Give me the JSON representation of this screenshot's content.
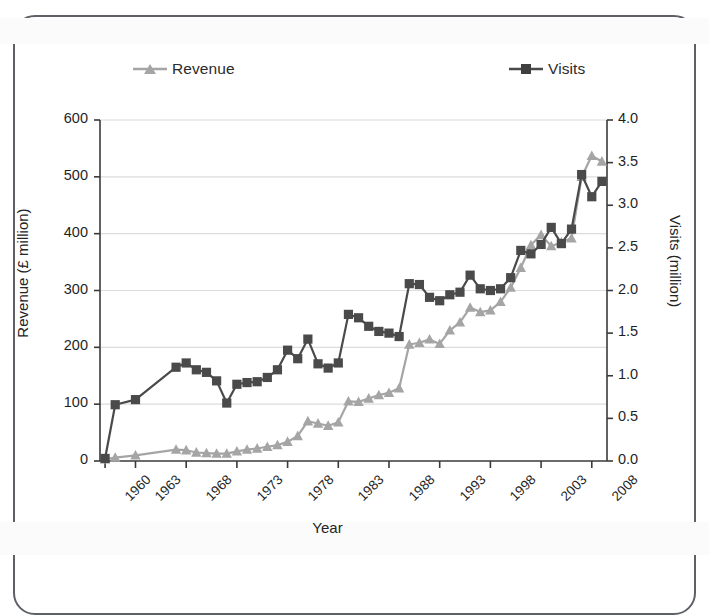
{
  "figure": {
    "kind": "line-chart",
    "background_color": "#ffffff",
    "frame_color": "#5d6166"
  },
  "legend": {
    "position": "top",
    "entries": [
      {
        "label": "Revenue",
        "marker": "triangle",
        "color": "#a5a5a5"
      },
      {
        "label": "Visits",
        "marker": "square",
        "color": "#4a4a4a"
      }
    ]
  },
  "axes": {
    "x": {
      "title": "Year",
      "tick_labels": [
        "1960",
        "1963",
        "1968",
        "1973",
        "1978",
        "1983",
        "1988",
        "1993",
        "1998",
        "2003",
        "2008"
      ],
      "tick_values": [
        1960,
        1963,
        1968,
        1973,
        1978,
        1983,
        1988,
        1993,
        1998,
        2003,
        2008
      ],
      "range": [
        1959.5,
        2009.5
      ]
    },
    "y_left": {
      "title": "Revenue (£ million)",
      "tick_labels": [
        "0",
        "100",
        "200",
        "300",
        "400",
        "500",
        "600"
      ],
      "tick_values": [
        0,
        100,
        200,
        300,
        400,
        500,
        600
      ],
      "range": [
        0,
        600
      ],
      "grid": true
    },
    "y_right": {
      "title": "Visits (million)",
      "tick_labels": [
        "0.0",
        "0.5",
        "1.0",
        "1.5",
        "2.0",
        "2.5",
        "3.0",
        "3.5",
        "4.0"
      ],
      "tick_values": [
        0.0,
        0.5,
        1.0,
        1.5,
        2.0,
        2.5,
        3.0,
        3.5,
        4.0
      ],
      "range": [
        0.0,
        4.0
      ],
      "grid": false
    }
  },
  "chart_data": {
    "type": "line",
    "title": "",
    "xlabel": "Year",
    "ylabel": "Revenue (£ million)",
    "ylabel_secondary": "Visits (million)",
    "xlim": [
      1959.5,
      2009.5
    ],
    "ylim": [
      0,
      600
    ],
    "ylim_secondary": [
      0.0,
      4.0
    ],
    "grid": true,
    "legend_position": "top",
    "series": [
      {
        "name": "Revenue",
        "axis": "left",
        "unit": "£ million",
        "color": "#a5a5a5",
        "marker": "triangle",
        "x": [
          1960,
          1961,
          1963,
          1967,
          1968,
          1969,
          1970,
          1971,
          1972,
          1973,
          1974,
          1975,
          1976,
          1977,
          1978,
          1979,
          1980,
          1981,
          1982,
          1983,
          1984,
          1985,
          1986,
          1987,
          1988,
          1989,
          1990,
          1991,
          1992,
          1993,
          1994,
          1995,
          1996,
          1997,
          1998,
          1999,
          2000,
          2001,
          2002,
          2003,
          2004,
          2005,
          2006,
          2007,
          2008,
          2009
        ],
        "values": [
          3,
          6,
          10,
          20,
          19,
          15,
          14,
          13,
          13,
          17,
          20,
          22,
          25,
          28,
          34,
          44,
          70,
          66,
          62,
          68,
          105,
          104,
          110,
          116,
          120,
          128,
          205,
          208,
          214,
          206,
          230,
          244,
          270,
          262,
          265,
          280,
          305,
          340,
          380,
          398,
          378,
          385,
          392,
          500,
          537,
          527
        ]
      },
      {
        "name": "Visits",
        "axis": "right",
        "unit": "million",
        "color": "#4a4a4a",
        "marker": "square",
        "x": [
          1960,
          1961,
          1963,
          1967,
          1968,
          1969,
          1970,
          1971,
          1972,
          1973,
          1974,
          1975,
          1976,
          1977,
          1978,
          1979,
          1980,
          1981,
          1982,
          1983,
          1984,
          1985,
          1986,
          1987,
          1988,
          1989,
          1990,
          1991,
          1992,
          1993,
          1994,
          1995,
          1996,
          1997,
          1998,
          1999,
          2000,
          2001,
          2002,
          2003,
          2004,
          2005,
          2006,
          2007,
          2008,
          2009
        ],
        "values": [
          0.03,
          0.66,
          0.72,
          1.1,
          1.15,
          1.07,
          1.04,
          0.94,
          0.68,
          0.9,
          0.92,
          0.93,
          0.98,
          1.07,
          1.3,
          1.2,
          1.43,
          1.14,
          1.09,
          1.15,
          1.72,
          1.68,
          1.58,
          1.52,
          1.5,
          1.46,
          2.08,
          2.07,
          1.92,
          1.88,
          1.95,
          1.98,
          2.18,
          2.02,
          2.0,
          2.02,
          2.15,
          2.47,
          2.43,
          2.54,
          2.74,
          2.55,
          2.72,
          3.36,
          3.1,
          3.28
        ]
      }
    ]
  }
}
